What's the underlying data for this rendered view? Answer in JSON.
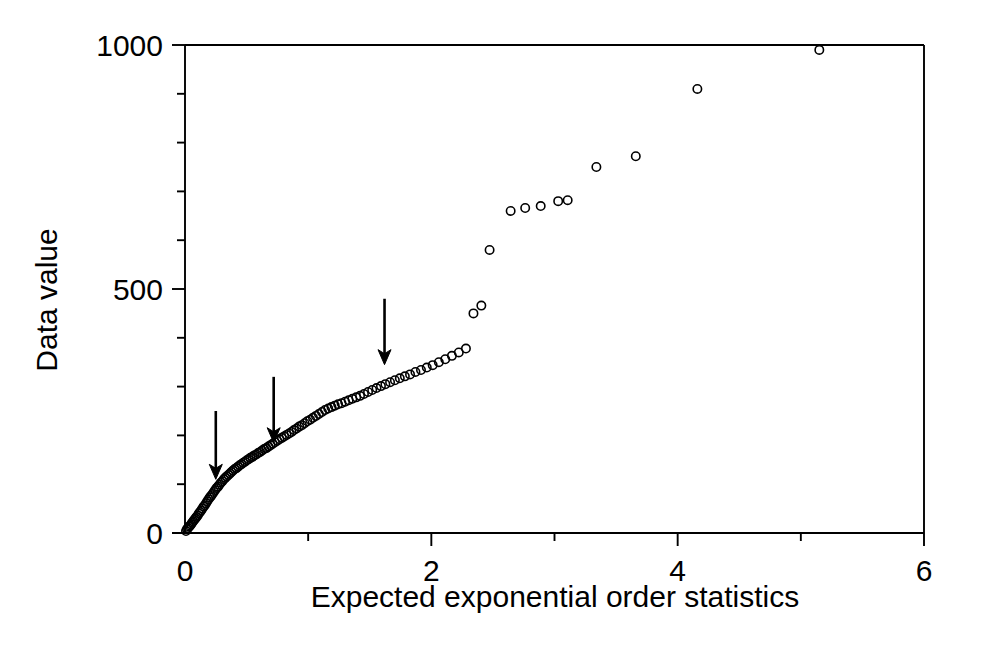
{
  "figure": {
    "background": "#ffffff",
    "ink_color": "#000000"
  },
  "chart_data": {
    "type": "scatter",
    "title": "",
    "subtitle": "",
    "xlabel": "Expected exponential order statistics",
    "ylabel": "Data value",
    "xlim": [
      0,
      6
    ],
    "ylim": [
      0,
      1000
    ],
    "x_major_ticks": [
      0,
      2,
      4,
      6
    ],
    "x_minor_ticks": [
      1,
      3,
      5
    ],
    "y_major_ticks": [
      0,
      500,
      1000
    ],
    "y_minor_ticks": [
      100,
      200,
      300,
      400,
      600,
      700,
      800,
      900
    ],
    "x_tick_labels": [
      "0",
      "2",
      "4",
      "6"
    ],
    "y_tick_labels": [
      "0",
      "500",
      "1000"
    ],
    "grid": false,
    "legend": null,
    "marker": {
      "shape": "open-circle",
      "radius": 4.2,
      "stroke": "#000000",
      "stroke_width": 1.6,
      "fill": "none"
    },
    "series": [
      {
        "name": "Ordered data vs expected exponential order statistics",
        "points": [
          [
            0.008,
            4
          ],
          [
            0.016,
            8
          ],
          [
            0.024,
            10
          ],
          [
            0.033,
            13
          ],
          [
            0.041,
            15
          ],
          [
            0.05,
            18
          ],
          [
            0.058,
            21
          ],
          [
            0.067,
            24
          ],
          [
            0.076,
            27
          ],
          [
            0.085,
            30
          ],
          [
            0.094,
            33
          ],
          [
            0.103,
            36
          ],
          [
            0.112,
            40
          ],
          [
            0.122,
            43
          ],
          [
            0.131,
            46
          ],
          [
            0.141,
            50
          ],
          [
            0.151,
            54
          ],
          [
            0.161,
            57
          ],
          [
            0.171,
            61
          ],
          [
            0.181,
            65
          ],
          [
            0.191,
            69
          ],
          [
            0.202,
            73
          ],
          [
            0.212,
            76
          ],
          [
            0.223,
            80
          ],
          [
            0.234,
            84
          ],
          [
            0.245,
            88
          ],
          [
            0.256,
            92
          ],
          [
            0.268,
            95
          ],
          [
            0.279,
            99
          ],
          [
            0.291,
            103
          ],
          [
            0.303,
            106
          ],
          [
            0.315,
            110
          ],
          [
            0.327,
            113
          ],
          [
            0.339,
            116
          ],
          [
            0.352,
            119
          ],
          [
            0.365,
            122
          ],
          [
            0.377,
            125
          ],
          [
            0.39,
            128
          ],
          [
            0.404,
            131
          ],
          [
            0.417,
            133
          ],
          [
            0.431,
            136
          ],
          [
            0.444,
            139
          ],
          [
            0.458,
            141
          ],
          [
            0.473,
            144
          ],
          [
            0.487,
            146
          ],
          [
            0.502,
            149
          ],
          [
            0.516,
            151
          ],
          [
            0.531,
            154
          ],
          [
            0.547,
            156
          ],
          [
            0.562,
            159
          ],
          [
            0.578,
            161
          ],
          [
            0.594,
            164
          ],
          [
            0.61,
            166
          ],
          [
            0.626,
            169
          ],
          [
            0.643,
            172
          ],
          [
            0.66,
            174
          ],
          [
            0.677,
            177
          ],
          [
            0.695,
            180
          ],
          [
            0.712,
            183
          ],
          [
            0.73,
            186
          ],
          [
            0.749,
            189
          ],
          [
            0.767,
            192
          ],
          [
            0.786,
            195
          ],
          [
            0.805,
            198
          ],
          [
            0.825,
            201
          ],
          [
            0.845,
            204
          ],
          [
            0.865,
            207
          ],
          [
            0.885,
            211
          ],
          [
            0.906,
            214
          ],
          [
            0.927,
            218
          ],
          [
            0.949,
            221
          ],
          [
            0.971,
            225
          ],
          [
            0.993,
            229
          ],
          [
            1.016,
            232
          ],
          [
            1.039,
            236
          ],
          [
            1.063,
            240
          ],
          [
            1.087,
            244
          ],
          [
            1.112,
            248
          ],
          [
            1.137,
            252
          ],
          [
            1.163,
            255
          ],
          [
            1.189,
            258
          ],
          [
            1.216,
            261
          ],
          [
            1.243,
            264
          ],
          [
            1.271,
            266
          ],
          [
            1.3,
            269
          ],
          [
            1.329,
            272
          ],
          [
            1.359,
            275
          ],
          [
            1.39,
            278
          ],
          [
            1.421,
            281
          ],
          [
            1.453,
            285
          ],
          [
            1.486,
            289
          ],
          [
            1.52,
            293
          ],
          [
            1.555,
            297
          ],
          [
            1.591,
            301
          ],
          [
            1.627,
            305
          ],
          [
            1.665,
            309
          ],
          [
            1.704,
            313
          ],
          [
            1.744,
            317
          ],
          [
            1.785,
            321
          ],
          [
            1.827,
            325
          ],
          [
            1.871,
            330
          ],
          [
            1.916,
            334
          ],
          [
            1.963,
            339
          ],
          [
            2.011,
            344
          ],
          [
            2.061,
            350
          ],
          [
            2.113,
            356
          ],
          [
            2.167,
            363
          ],
          [
            2.223,
            370
          ],
          [
            2.281,
            378
          ],
          [
            2.342,
            450
          ],
          [
            2.406,
            466
          ],
          [
            2.473,
            580
          ],
          [
            2.644,
            660
          ],
          [
            2.762,
            666
          ],
          [
            2.888,
            670
          ],
          [
            3.03,
            680
          ],
          [
            3.107,
            682
          ],
          [
            3.34,
            750
          ],
          [
            3.66,
            772
          ],
          [
            4.16,
            910
          ],
          [
            5.15,
            990
          ]
        ]
      }
    ],
    "annotations": [
      {
        "type": "arrow",
        "direction": "down",
        "x": 0.25,
        "y_tip": 110,
        "y_tail": 250,
        "label": ""
      },
      {
        "type": "arrow",
        "direction": "down",
        "x": 0.72,
        "y_tip": 185,
        "y_tail": 320,
        "label": ""
      },
      {
        "type": "arrow",
        "direction": "down",
        "x": 1.62,
        "y_tip": 345,
        "y_tail": 480,
        "label": ""
      }
    ]
  }
}
